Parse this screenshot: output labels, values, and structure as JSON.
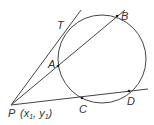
{
  "diagram": {
    "colors": {
      "stroke": "#444444",
      "text": "#333333",
      "background": "#ffffff"
    },
    "circle": {
      "cx": 102,
      "cy": 59,
      "r": 44
    },
    "points": {
      "P": {
        "label": "P",
        "x": 11,
        "y": 105
      },
      "T": {
        "label": "T",
        "x": 62,
        "y": 31
      },
      "A": {
        "label": "A",
        "x": 58,
        "y": 66
      },
      "B": {
        "label": "B",
        "x": 117,
        "y": 16
      },
      "C": {
        "label": "C",
        "x": 82,
        "y": 98
      },
      "D": {
        "label": "D",
        "x": 129,
        "y": 91
      }
    },
    "p_coords": {
      "open": "(x",
      "sub1": "1",
      "comma": ", y",
      "sub2": "1",
      "close": ")"
    }
  }
}
